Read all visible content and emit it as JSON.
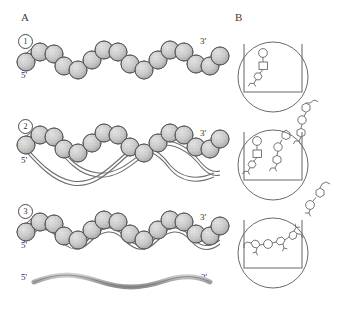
{
  "figure": {
    "panels": [
      {
        "id": "A",
        "letter": "A",
        "description": "Chromatin fiber condensation states: nucleosome beads-on-a-string progressively compacting, plus naked DNA strand"
      },
      {
        "id": "B",
        "letter": "B",
        "description": "Three cup-in-circle vessels showing progressive uptake and ordering of small molecules"
      }
    ]
  },
  "panelA": {
    "letter": "A",
    "rows": [
      {
        "number": "1",
        "label_five_prime": "5'",
        "label_three_prime": "3'",
        "state": "extended-beads-on-a-string",
        "bead_count": 16
      },
      {
        "number": "2",
        "label_five_prime": "5'",
        "label_three_prime": "3'",
        "state": "partially-wrapped-with-free-linker",
        "bead_count": 16
      },
      {
        "number": "3",
        "label_five_prime": "5'",
        "label_three_prime": "3'",
        "state": "compacted-coiled",
        "bead_count": 16
      },
      {
        "number": "",
        "label_five_prime": "5'",
        "label_three_prime": "3'",
        "state": "naked-single-strand",
        "bead_count": 0
      }
    ]
  },
  "panelB": {
    "letter": "B",
    "units": [
      {
        "index": "1",
        "molecules_inside": 1,
        "molecules_outside": 0,
        "state": "single-molecule-in-vessel"
      },
      {
        "index": "2",
        "molecules_inside": 2,
        "molecules_outside": 1,
        "state": "molecule-entering-vessel"
      },
      {
        "index": "3",
        "molecules_inside": 5,
        "molecules_outside": 1,
        "state": "chain-assembled-in-vessel"
      }
    ]
  },
  "colors": {
    "background": "#ffffff",
    "bead_fill": "#c9c9c9",
    "bead_stroke": "#5a5a5a",
    "strand_stroke": "#6a6a6a",
    "molecule_stroke": "#5f5f5f",
    "vessel_stroke": "#6a6a6a",
    "text": "#2b2b2b"
  }
}
